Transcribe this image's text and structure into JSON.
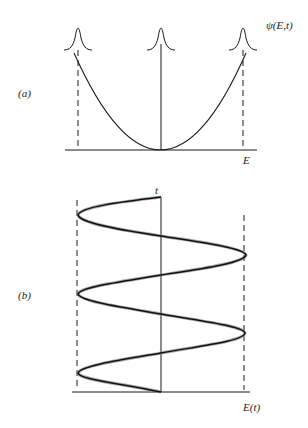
{
  "figure": {
    "panel_a": {
      "label": "(a)",
      "axis_label_x": "E",
      "wavefunction_label": "ψ(E,t)",
      "description": "Parabolic potential with Gaussian wave packets at turning points and center"
    },
    "panel_b": {
      "label": "(b)",
      "axis_label_x": "E(t)",
      "axis_label_y": "t",
      "description": "Oscillating energy expectation versus time between two turning points"
    },
    "colors": {
      "line": "#1a1a1a",
      "background": "#ffffff"
    }
  }
}
